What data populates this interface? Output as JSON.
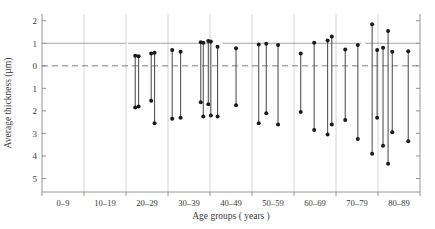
{
  "chart_data": {
    "type": "scatter",
    "title": "",
    "xlabel": "Age groups ( years )",
    "ylabel": "Average thickness (µm)",
    "categories": [
      "0–9",
      "10–19",
      "20–29",
      "30–39",
      "40–49",
      "50–59",
      "60–69",
      "70–79",
      "80–89"
    ],
    "ytick_labels": [
      "2",
      "1",
      "0",
      "1",
      "2",
      "3",
      "4",
      "5"
    ],
    "ytick_values": [
      2,
      1,
      0,
      -1,
      -2,
      -3,
      -4,
      -5
    ],
    "ylim": [
      -5.6,
      2.3
    ],
    "y_axis_inverted": true,
    "grid": "vertical gridlines at age-group boundaries",
    "reference_lines": [
      {
        "y": 1,
        "style": "solid",
        "label": "upper reference"
      },
      {
        "y": 0,
        "style": "dashed",
        "label": "zero line"
      }
    ],
    "legend": "none",
    "marker": "filled circle at both ends of each vertical range segment",
    "series": [
      {
        "name": "Average thickness range per subject",
        "note": "each entry is a vertical segment: x position in age-group units, top value, bottom value",
        "points": [
          {
            "group": "20–29",
            "x": 2.22,
            "top": 0.45,
            "bottom": -1.85
          },
          {
            "group": "20–29",
            "x": 2.3,
            "top": 0.42,
            "bottom": -1.8
          },
          {
            "group": "20–29",
            "x": 2.6,
            "top": 0.55,
            "bottom": -1.55
          },
          {
            "group": "20–29",
            "x": 2.68,
            "top": 0.58,
            "bottom": -2.55
          },
          {
            "group": "30–39",
            "x": 3.1,
            "top": 0.7,
            "bottom": -2.35
          },
          {
            "group": "30–39",
            "x": 3.3,
            "top": 0.62,
            "bottom": -2.3
          },
          {
            "group": "30–39",
            "x": 3.78,
            "top": 1.05,
            "bottom": -1.62
          },
          {
            "group": "30–39",
            "x": 3.84,
            "top": 1.02,
            "bottom": -2.25
          },
          {
            "group": "40–49",
            "x": 3.96,
            "top": 1.1,
            "bottom": -1.7
          },
          {
            "group": "40–49",
            "x": 4.02,
            "top": 1.08,
            "bottom": -2.2
          },
          {
            "group": "40–49",
            "x": 4.18,
            "top": 0.85,
            "bottom": -2.25
          },
          {
            "group": "40–49",
            "x": 4.62,
            "top": 0.78,
            "bottom": -1.75
          },
          {
            "group": "50–59",
            "x": 5.16,
            "top": 0.95,
            "bottom": -2.55
          },
          {
            "group": "50–59",
            "x": 5.34,
            "top": 0.98,
            "bottom": -2.1
          },
          {
            "group": "50–59",
            "x": 5.62,
            "top": 0.92,
            "bottom": -2.6
          },
          {
            "group": "60–69",
            "x": 6.16,
            "top": 0.55,
            "bottom": -2.05
          },
          {
            "group": "60–69",
            "x": 6.48,
            "top": 1.02,
            "bottom": -2.85
          },
          {
            "group": "60–69",
            "x": 6.8,
            "top": 1.12,
            "bottom": -3.05
          },
          {
            "group": "60–69",
            "x": 6.9,
            "top": 1.3,
            "bottom": -2.6
          },
          {
            "group": "70–79",
            "x": 7.22,
            "top": 0.72,
            "bottom": -2.4
          },
          {
            "group": "70–79",
            "x": 7.52,
            "top": 0.92,
            "bottom": -3.25
          },
          {
            "group": "70–79",
            "x": 7.86,
            "top": 1.85,
            "bottom": -3.9
          },
          {
            "group": "70–79",
            "x": 7.98,
            "top": 0.7,
            "bottom": -2.3
          },
          {
            "group": "80–89",
            "x": 8.12,
            "top": 0.8,
            "bottom": -3.55
          },
          {
            "group": "80–89",
            "x": 8.24,
            "top": 1.55,
            "bottom": -4.35
          },
          {
            "group": "80–89",
            "x": 8.34,
            "top": 0.62,
            "bottom": -2.95
          },
          {
            "group": "80–89",
            "x": 8.72,
            "top": 0.65,
            "bottom": -3.35
          }
        ]
      }
    ],
    "colors": {
      "marker": "#1a1a1a",
      "segment": "#555555",
      "grid": "#c9c9c9",
      "axis": "#8a8a8a",
      "reference_solid": "#9a9a9a",
      "reference_dashed": "#6e6e6e"
    }
  }
}
